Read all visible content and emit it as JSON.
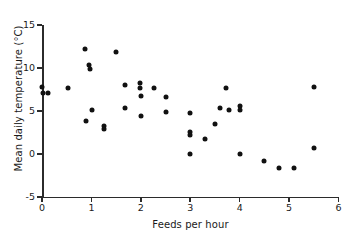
{
  "chart_data": {
    "type": "scatter",
    "title": "",
    "xlabel": "Feeds per hour",
    "ylabel": "Mean daily temperature (°C)",
    "xlim": [
      0,
      6
    ],
    "ylim": [
      -5,
      15
    ],
    "xticks": [
      0,
      1,
      2,
      3,
      4,
      5,
      6
    ],
    "xticklabels": [
      "0",
      "1",
      "2",
      "3",
      "4",
      "5",
      "6"
    ],
    "yticks": [
      -5,
      0,
      5,
      10,
      15
    ],
    "yticklabels": [
      "-5",
      "0",
      "5",
      "10",
      "15"
    ],
    "grid": false,
    "legend": false,
    "marker": "filled-circle",
    "marker_color": "#111111",
    "points": [
      {
        "x": 0.0,
        "y": 7.8
      },
      {
        "x": 0.02,
        "y": 7.1
      },
      {
        "x": 0.12,
        "y": 7.1
      },
      {
        "x": 0.52,
        "y": 7.7
      },
      {
        "x": 0.88,
        "y": 12.2
      },
      {
        "x": 0.95,
        "y": 10.3
      },
      {
        "x": 0.97,
        "y": 9.9
      },
      {
        "x": 1.02,
        "y": 5.1
      },
      {
        "x": 0.9,
        "y": 3.8
      },
      {
        "x": 1.25,
        "y": 3.3
      },
      {
        "x": 1.25,
        "y": 2.9
      },
      {
        "x": 1.5,
        "y": 11.9
      },
      {
        "x": 1.67,
        "y": 8.0
      },
      {
        "x": 1.67,
        "y": 5.4
      },
      {
        "x": 1.98,
        "y": 8.2
      },
      {
        "x": 1.98,
        "y": 7.7
      },
      {
        "x": 2.0,
        "y": 6.7
      },
      {
        "x": 2.0,
        "y": 4.4
      },
      {
        "x": 2.27,
        "y": 7.7
      },
      {
        "x": 2.5,
        "y": 6.6
      },
      {
        "x": 2.5,
        "y": 4.9
      },
      {
        "x": 3.0,
        "y": 4.8
      },
      {
        "x": 3.0,
        "y": 2.6
      },
      {
        "x": 3.0,
        "y": 2.2
      },
      {
        "x": 3.0,
        "y": 0.0
      },
      {
        "x": 3.3,
        "y": 1.8
      },
      {
        "x": 3.5,
        "y": 3.5
      },
      {
        "x": 3.6,
        "y": 5.3
      },
      {
        "x": 3.72,
        "y": 7.7
      },
      {
        "x": 3.78,
        "y": 5.1
      },
      {
        "x": 4.0,
        "y": 5.6
      },
      {
        "x": 4.0,
        "y": 5.1
      },
      {
        "x": 4.0,
        "y": 0.0
      },
      {
        "x": 4.5,
        "y": -0.8
      },
      {
        "x": 4.8,
        "y": -1.6
      },
      {
        "x": 5.1,
        "y": -1.6
      },
      {
        "x": 5.5,
        "y": 7.8
      },
      {
        "x": 5.5,
        "y": 0.7
      }
    ]
  }
}
